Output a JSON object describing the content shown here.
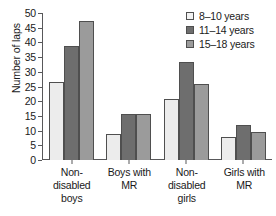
{
  "chart_data": {
    "type": "bar",
    "title": "",
    "xlabel": "",
    "ylabel": "Number of laps",
    "ylim": [
      0,
      50
    ],
    "ytick_step": 5,
    "yticks": [
      0,
      5,
      10,
      15,
      20,
      25,
      30,
      35,
      40,
      45,
      50
    ],
    "grid": false,
    "legend_position": "top-right",
    "categories": [
      "Non-disabled boys",
      "Boys with MR",
      "Non-disabled girls",
      "Girls with MR"
    ],
    "category_label_lines": [
      [
        "Non-",
        "disabled",
        "boys"
      ],
      [
        "Boys with",
        "MR"
      ],
      [
        "Non-",
        "disabled",
        "girls"
      ],
      [
        "Girls with",
        "MR"
      ]
    ],
    "series": [
      {
        "name": "8–10 years",
        "color": "#ececec",
        "values": [
          26.7,
          8.7,
          20.7,
          7.7
        ]
      },
      {
        "name": "11–14 years",
        "color": "#6e6e6e",
        "values": [
          38.8,
          15.6,
          33.3,
          12.0
        ]
      },
      {
        "name": "15–18 years",
        "color": "#9b9b9b",
        "values": [
          47.2,
          15.6,
          25.8,
          9.4
        ]
      }
    ]
  }
}
